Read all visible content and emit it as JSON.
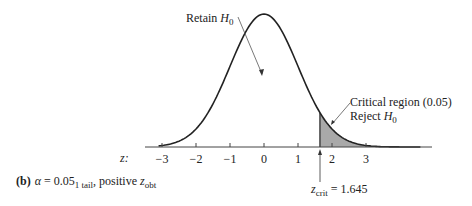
{
  "diagram": {
    "type": "normal-distribution-one-tailed-test",
    "caption": {
      "prefix": "(b)",
      "alpha_symbol": "α",
      "alpha_equals": " = 0.05",
      "alpha_subscript": "1 tail",
      "suffix": ", positive ",
      "z": "z",
      "z_subscript": "obt"
    },
    "retain_label": {
      "text": "Retain ",
      "h": "H",
      "sub": "0"
    },
    "critical_label": {
      "line1": "Critical region (0.05)",
      "line2_text": "Reject ",
      "h": "H",
      "sub": "0"
    },
    "z_crit_label": {
      "z": "z",
      "sub": "crit",
      "value": " = 1.645"
    },
    "axis": {
      "label": "z:",
      "ticks": [
        "−3",
        "−2",
        "−1",
        "0",
        "1",
        "2",
        "3"
      ]
    },
    "colors": {
      "curve": "#222222",
      "shade": "#a9a9a9",
      "text": "#222222"
    }
  },
  "chart_data": {
    "type": "area",
    "title": "",
    "xlabel": "z",
    "ylabel": "",
    "xlim": [
      -3.2,
      4.9
    ],
    "x_ticks": [
      -3,
      -2,
      -1,
      0,
      1,
      2,
      3
    ],
    "distribution": "standard normal",
    "shaded_region": {
      "from": 1.645,
      "to": 4.9,
      "area": 0.05
    },
    "z_crit": 1.645,
    "annotations": [
      "Retain H0",
      "Critical region (0.05)",
      "Reject H0",
      "z_crit = 1.645"
    ],
    "grid": false
  }
}
